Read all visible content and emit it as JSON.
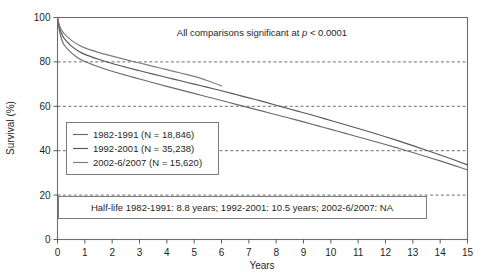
{
  "chart_data": {
    "type": "line",
    "title": "",
    "xlabel": "Years",
    "ylabel": "Survival (%)",
    "xlim": [
      0,
      15
    ],
    "ylim": [
      0,
      100
    ],
    "xticks": [
      "0",
      "1",
      "2",
      "3",
      "4",
      "5",
      "6",
      "7",
      "8",
      "9",
      "10",
      "11",
      "12",
      "13",
      "14",
      "15"
    ],
    "yticks": [
      "0",
      "20",
      "40",
      "60",
      "80",
      "100"
    ],
    "grid": "horizontal-dashed",
    "legend_position": "center-left-inside",
    "annotations": {
      "significance_prefix": "All comparisons significant at ",
      "significance_italic": "p",
      "significance_suffix": " < 0.0001",
      "halflife": "Half-life 1982-1991: 8.8 years; 1992-2001: 10.5 years; 2002-6/2007: NA"
    },
    "series": [
      {
        "name": "1982-1991 (N = 18,846)",
        "label": "1982-1991",
        "n": "18,846",
        "halflife": "8.8 years",
        "color": "#6a6a6a",
        "x": [
          0,
          0.08,
          0.17,
          0.25,
          0.5,
          0.75,
          1,
          1.5,
          2,
          2.5,
          3,
          3.5,
          4,
          4.5,
          5,
          5.5,
          6,
          6.5,
          7,
          7.5,
          8,
          8.5,
          9,
          9.5,
          10,
          10.5,
          11,
          11.5,
          12,
          12.5,
          13,
          13.5,
          14,
          14.5,
          15
        ],
        "y": [
          100,
          93.5,
          89.5,
          87.5,
          84.2,
          81.8,
          80.2,
          77.8,
          75.8,
          74.0,
          72.3,
          70.6,
          69.0,
          67.4,
          65.8,
          64.2,
          62.6,
          61.0,
          59.4,
          57.8,
          56.2,
          54.6,
          53.0,
          51.3,
          49.6,
          47.9,
          46.2,
          44.5,
          42.8,
          41.0,
          39.2,
          37.3,
          35.4,
          33.4,
          31.3
        ]
      },
      {
        "name": "1992-2001 (N = 35,238)",
        "label": "1992-2001",
        "n": "35,238",
        "halflife": "10.5 years",
        "color": "#585858",
        "x": [
          0,
          0.08,
          0.17,
          0.25,
          0.5,
          0.75,
          1,
          1.5,
          2,
          2.5,
          3,
          3.5,
          4,
          4.5,
          5,
          5.5,
          6,
          6.5,
          7,
          7.5,
          8,
          8.5,
          9,
          9.5,
          10,
          10.5,
          11,
          11.5,
          12,
          12.5,
          13,
          13.5,
          14,
          14.5,
          15
        ],
        "y": [
          100,
          95.0,
          92.2,
          90.5,
          87.2,
          85.0,
          83.4,
          81.2,
          79.3,
          77.6,
          76.0,
          74.5,
          73.0,
          71.5,
          70.0,
          68.5,
          67.0,
          65.4,
          63.8,
          62.2,
          60.5,
          58.8,
          57.1,
          55.4,
          53.6,
          51.8,
          50.0,
          48.2,
          46.3,
          44.3,
          42.3,
          40.2,
          38.1,
          35.9,
          33.6
        ]
      },
      {
        "name": "2002-6/2007 (N = 15,620)",
        "label": "2002-6/2007",
        "n": "15,620",
        "halflife": "NA",
        "color": "#7d7d7d",
        "x": [
          0,
          0.08,
          0.17,
          0.25,
          0.5,
          0.75,
          1,
          1.5,
          2,
          2.5,
          3,
          3.5,
          4,
          4.5,
          5,
          5.5,
          6
        ],
        "y": [
          100,
          96.2,
          94.0,
          92.6,
          89.8,
          87.8,
          86.3,
          84.3,
          82.6,
          81.0,
          79.5,
          78.0,
          76.5,
          75.0,
          73.5,
          71.5,
          69.2
        ]
      }
    ]
  },
  "legend": {
    "items": [
      {
        "label": "1982-1991 (N = 18,846)"
      },
      {
        "label": "1992-2001 (N = 35,238)"
      },
      {
        "label": "2002-6/2007 (N = 15,620)"
      }
    ]
  }
}
